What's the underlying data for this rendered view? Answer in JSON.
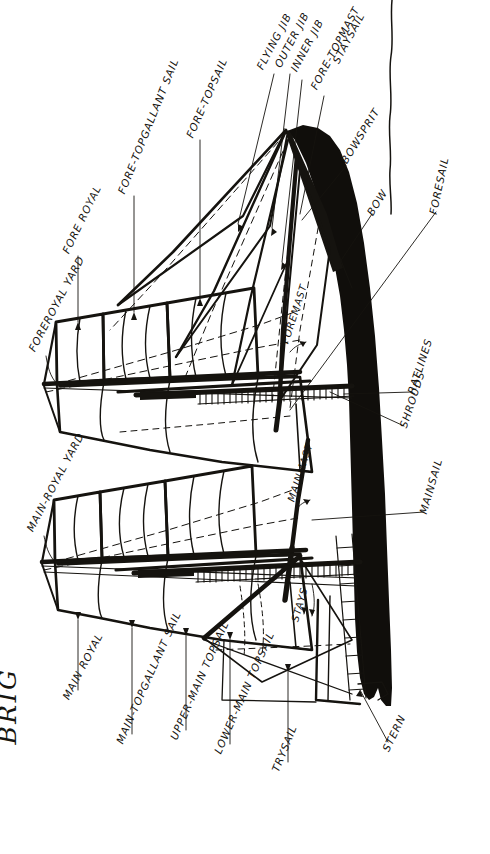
{
  "figure": {
    "title": "BRIG",
    "kind": "hand-drawn sail-plan diagram",
    "ink_color": "#15130f",
    "hull_color": "#100e0b",
    "paper_color": "#ffffff",
    "rotation_note": "sheet drawn sideways; all lettering reads bottom-to-top"
  },
  "labels": [
    {
      "id": "foreroyal-yard",
      "text": "FOREROYAL YARD"
    },
    {
      "id": "fore-royal",
      "text": "FORE ROYAL"
    },
    {
      "id": "fore-topgallant-sail",
      "text": "FORE-TOPGALLANT SAIL"
    },
    {
      "id": "fore-topsail",
      "text": "FORE-TOPSAIL"
    },
    {
      "id": "flying-jib",
      "text": "FLYING JIB"
    },
    {
      "id": "outer-jib",
      "text": "OUTER JIB"
    },
    {
      "id": "inner-jib",
      "text": "INNER JIB"
    },
    {
      "id": "fore-topmast-staysail-1",
      "text": "FORE-TOPMAST"
    },
    {
      "id": "fore-topmast-staysail-2",
      "text": "STAYSAIL"
    },
    {
      "id": "bowsprit",
      "text": "BOWSPRIT"
    },
    {
      "id": "bow",
      "text": "BOW"
    },
    {
      "id": "foresail",
      "text": "FORESAIL"
    },
    {
      "id": "foremast",
      "text": "FOREMAST"
    },
    {
      "id": "ratlines",
      "text": "RATLINES"
    },
    {
      "id": "shrouds",
      "text": "SHROUDS"
    },
    {
      "id": "mainsail",
      "text": "MAINSAIL"
    },
    {
      "id": "mainmast",
      "text": "MAINMAST"
    },
    {
      "id": "main-royal-yard",
      "text": "MAIN-ROYAL YARD"
    },
    {
      "id": "main-royal",
      "text": "MAIN ROYAL"
    },
    {
      "id": "main-topgallant-sail",
      "text": "MAIN-TOPGALLANT SAIL"
    },
    {
      "id": "upper-main-topsail",
      "text": "UPPER-MAIN TOPSAIL"
    },
    {
      "id": "lower-main-topsail",
      "text": "LOWER-MAIN TOPSAIL"
    },
    {
      "id": "trysail",
      "text": "TRYSAIL"
    },
    {
      "id": "stays",
      "text": "STAYS"
    },
    {
      "id": "stern",
      "text": "STERN"
    }
  ]
}
